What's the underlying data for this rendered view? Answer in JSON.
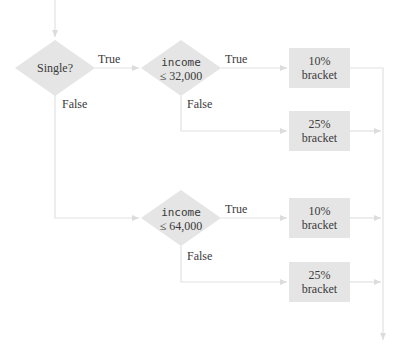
{
  "diagram": {
    "colors": {
      "shape_fill": "#e5e5e5",
      "line": "#e2e2e2",
      "text": "#3a3a3a",
      "background": "#ffffff"
    },
    "decisions": [
      {
        "id": "single",
        "lines": [
          "Single?"
        ]
      },
      {
        "id": "income_32000",
        "line1": "income",
        "line2": "≤ 32,000"
      },
      {
        "id": "income_64000",
        "line1": "income",
        "line2": "≤ 64,000"
      }
    ],
    "outcomes": [
      {
        "line1": "10%",
        "line2": "bracket"
      },
      {
        "line1": "25%",
        "line2": "bracket"
      },
      {
        "line1": "10%",
        "line2": "bracket"
      },
      {
        "line1": "25%",
        "line2": "bracket"
      }
    ],
    "edge_labels": {
      "single_true": "True",
      "single_false": "False",
      "d2_true": "True",
      "d2_false": "False",
      "d3_true": "True",
      "d3_false": "False"
    }
  }
}
